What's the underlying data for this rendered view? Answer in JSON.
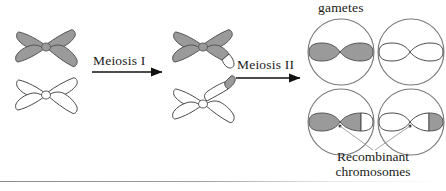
{
  "figure": {
    "type": "biology-diagram",
    "labels": {
      "meiosis_1": "Meiosis I",
      "meiosis_2": "Meiosis II",
      "gametes": "gametes",
      "recombinant_line1": "Recombinant",
      "recombinant_line2": "chromosomes"
    },
    "colors": {
      "shaded_chromosome_fill": "#9a9a9a",
      "shaded_chromosome_stroke": "#555555",
      "unshaded_chromosome_fill": "#ffffff",
      "unshaded_chromosome_stroke": "#4a4a4a",
      "cell_membrane_stroke": "#7a7a7a",
      "arrow_color": "#111111",
      "text_color": "#1a1a1a",
      "leader_line_color": "#8a8a8a"
    },
    "stages": [
      {
        "name": "before-meiosis-i",
        "position": "left",
        "chromosomes": [
          {
            "name": "homolog-shaded",
            "shape": "replicated-x",
            "fill": "shaded",
            "recombinant": false
          },
          {
            "name": "homolog-unshaded",
            "shape": "replicated-x",
            "fill": "unshaded",
            "recombinant": false
          }
        ]
      },
      {
        "name": "after-meiosis-i",
        "position": "middle",
        "chromosomes": [
          {
            "name": "homolog-shaded-crossed",
            "shape": "replicated-x",
            "fill": "shaded",
            "recombinant": true,
            "tip": "unshaded"
          },
          {
            "name": "homolog-unshaded-crossed",
            "shape": "replicated-x",
            "fill": "unshaded",
            "recombinant": true,
            "tip": "shaded"
          }
        ]
      },
      {
        "name": "after-meiosis-ii",
        "position": "right",
        "gamete_cells": [
          {
            "name": "gamete-top-left",
            "chromosome_fill": "shaded",
            "recombinant": false,
            "tip": "none"
          },
          {
            "name": "gamete-top-right",
            "chromosome_fill": "unshaded",
            "recombinant": false,
            "tip": "none"
          },
          {
            "name": "gamete-bottom-left",
            "chromosome_fill": "shaded",
            "recombinant": true,
            "tip": "unshaded"
          },
          {
            "name": "gamete-bottom-right",
            "chromosome_fill": "unshaded",
            "recombinant": true,
            "tip": "shaded"
          }
        ]
      }
    ]
  }
}
